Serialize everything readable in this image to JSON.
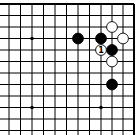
{
  "diagram": {
    "type": "go-board-corner",
    "corner": "top-right",
    "grid": {
      "x_lines": [
        9,
        20.5,
        32,
        43.5,
        55,
        66.5,
        78,
        89.5,
        101,
        112,
        123,
        134
      ],
      "y_lines": [
        4,
        15.5,
        27,
        38.5,
        50,
        61.5,
        73,
        84.5,
        96,
        107.5,
        119,
        130.5
      ],
      "line_color": "#000000",
      "edge_top": true,
      "edge_right": true
    },
    "star_points": [
      {
        "col": 2,
        "row": 3
      },
      {
        "col": 2,
        "row": 9
      },
      {
        "col": 8,
        "row": 9
      }
    ],
    "stones": [
      {
        "color": "black",
        "col": 6,
        "row": 3,
        "label": ""
      },
      {
        "color": "black",
        "col": 8,
        "row": 3,
        "label": ""
      },
      {
        "color": "black",
        "col": 9,
        "row": 4,
        "label": ""
      },
      {
        "color": "black",
        "col": 9,
        "row": 7,
        "label": ""
      },
      {
        "color": "white",
        "col": 9,
        "row": 2,
        "label": ""
      },
      {
        "color": "white",
        "col": 10,
        "row": 3,
        "label": ""
      },
      {
        "color": "white",
        "col": 8,
        "row": 4,
        "label": "1"
      },
      {
        "color": "white",
        "col": 9,
        "row": 5,
        "label": ""
      }
    ]
  }
}
